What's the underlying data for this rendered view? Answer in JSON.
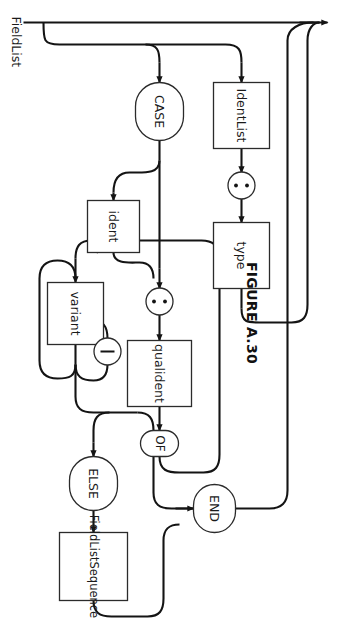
{
  "figure": {
    "caption": "FIGURE A.30",
    "production_name": "FieldList",
    "orientation_degrees": 90,
    "background_color": "#ffffff",
    "line_color": "#141414",
    "shape_fill": "#ffffff",
    "shape_stroke": "#2b2b2b"
  },
  "diagram": {
    "type": "railroad-syntax-diagram",
    "entry_label": "FieldList",
    "nodes": [
      {
        "id": "identlist",
        "label": "IdentList",
        "shape": "rect",
        "kind": "nonterminal"
      },
      {
        "id": "colon1",
        "label": ":",
        "shape": "circle",
        "kind": "terminal"
      },
      {
        "id": "type",
        "label": "type",
        "shape": "rect",
        "kind": "nonterminal"
      },
      {
        "id": "case",
        "label": "CASE",
        "shape": "stadium",
        "kind": "keyword"
      },
      {
        "id": "ident",
        "label": "ident",
        "shape": "rect",
        "kind": "nonterminal"
      },
      {
        "id": "colon2",
        "label": ":",
        "shape": "circle",
        "kind": "terminal"
      },
      {
        "id": "qualident",
        "label": "qualident",
        "shape": "rect",
        "kind": "nonterminal"
      },
      {
        "id": "of",
        "label": "OF",
        "shape": "stadium",
        "kind": "keyword"
      },
      {
        "id": "variant",
        "label": "variant",
        "shape": "rect",
        "kind": "nonterminal"
      },
      {
        "id": "bar",
        "label": "|",
        "shape": "circle",
        "kind": "terminal"
      },
      {
        "id": "else",
        "label": "ELSE",
        "shape": "stadium",
        "kind": "keyword"
      },
      {
        "id": "fieldlistsequence",
        "label": "FieldListSequence",
        "shape": "rect",
        "kind": "nonterminal"
      },
      {
        "id": "end",
        "label": "END",
        "shape": "stadium",
        "kind": "keyword"
      }
    ],
    "branches": [
      {
        "name": "empty-bypass",
        "path": [
          "entry",
          "exit"
        ]
      },
      {
        "name": "field-declaration",
        "path": [
          "entry",
          "identlist",
          "colon1",
          "type",
          "exit"
        ]
      },
      {
        "name": "case-variant",
        "path": [
          "entry",
          "case",
          "ident",
          "colon2",
          "qualident",
          "of",
          "variant",
          "else",
          "fieldlistsequence",
          "end",
          "exit"
        ]
      }
    ],
    "optional_parts": [
      "ident",
      "colon2",
      "else",
      "fieldlistsequence"
    ],
    "repeating_parts": [
      {
        "body": "variant",
        "separator": "bar"
      }
    ]
  }
}
